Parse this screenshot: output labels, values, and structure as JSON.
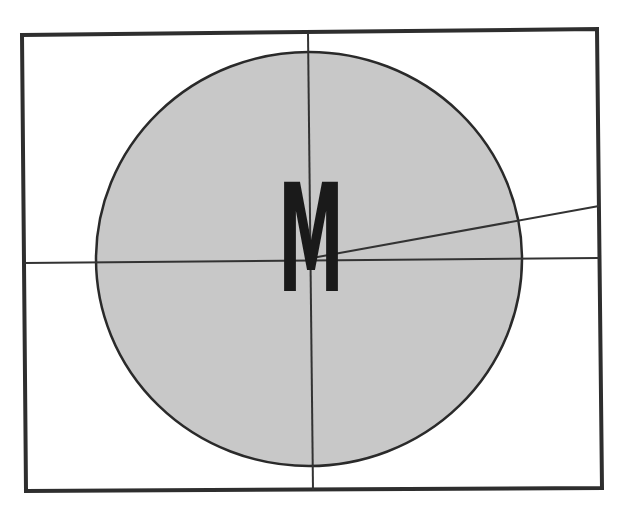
{
  "diagram": {
    "frame": {
      "points": [
        [
          22,
          35
        ],
        [
          597,
          29
        ],
        [
          602,
          488
        ],
        [
          26,
          491
        ]
      ],
      "stroke": "#2e2e2e"
    },
    "circle": {
      "cx": 309,
      "cy": 259,
      "rx": 213,
      "ry": 207,
      "fill": "#c8c8c8",
      "stroke": "#2a2a2a"
    },
    "lines": [
      {
        "name": "horizontal-axis",
        "x1": 24,
        "y1": 263,
        "x2": 599,
        "y2": 258
      },
      {
        "name": "vertical-axis",
        "x1": 308,
        "y1": 33,
        "x2": 313,
        "y2": 490
      },
      {
        "name": "diagonal-ray",
        "x1": 312,
        "y1": 258,
        "x2": 599,
        "y2": 206
      }
    ],
    "label": {
      "text": "M",
      "x": 311,
      "y": 291,
      "color": "#1a1a1a"
    }
  }
}
